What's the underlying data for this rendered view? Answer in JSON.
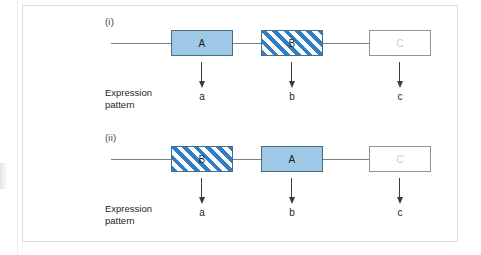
{
  "figure": {
    "border_color": "#cfe0ec",
    "background": "#ffffff",
    "panels": [
      {
        "id": "i",
        "label": "(i)",
        "caption_line1": "Expression",
        "caption_line2": "pattern",
        "genes": [
          {
            "name": "A",
            "style": "solid"
          },
          {
            "name": "B",
            "style": "hatched"
          },
          {
            "name": "C",
            "style": "empty"
          }
        ],
        "outputs": [
          "a",
          "b",
          "c"
        ]
      },
      {
        "id": "ii",
        "label": "(ii)",
        "caption_line1": "Expression",
        "caption_line2": "pattern",
        "genes": [
          {
            "name": "B",
            "style": "hatched"
          },
          {
            "name": "A",
            "style": "solid"
          },
          {
            "name": "C",
            "style": "empty"
          }
        ],
        "outputs": [
          "a",
          "b",
          "c"
        ]
      }
    ]
  },
  "colors": {
    "solid_fill": "#9ec8e6",
    "hatch_stripe": "#2f7fc4",
    "box_border": "#4a6d87",
    "empty_box_border": "#8d9398",
    "empty_box_text": "#b9d4e8",
    "connector": "#7a7f83",
    "arrow": "#3b3b3b",
    "frame": "#cfe0ec"
  }
}
